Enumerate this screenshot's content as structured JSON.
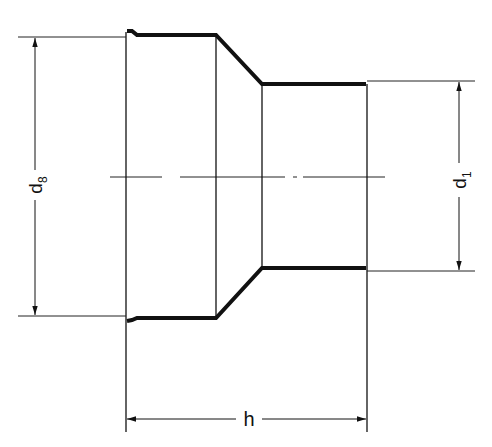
{
  "diagram": {
    "type": "technical-drawing",
    "colors": {
      "line": "#111111",
      "background": "#ffffff"
    },
    "dimensions": [
      {
        "id": "d8",
        "label": "d",
        "subscript": "8",
        "meaning": "large end outer diameter"
      },
      {
        "id": "d1",
        "label": "d",
        "subscript": "1",
        "meaning": "small end outer diameter"
      },
      {
        "id": "h",
        "label": "h",
        "meaning": "overall length"
      }
    ]
  }
}
